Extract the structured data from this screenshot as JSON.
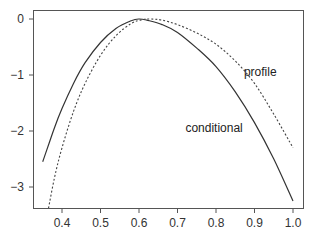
{
  "chart_data": {
    "type": "line",
    "title": "",
    "xlabel": "",
    "ylabel": "",
    "xlim": [
      0.33,
      1.025
    ],
    "ylim": [
      -3.38,
      0.18
    ],
    "grid": false,
    "legend": "none (direct labels)",
    "x_ticks": [
      0.4,
      0.5,
      0.6,
      0.7,
      0.8,
      0.9,
      1.0
    ],
    "x_tick_labels": [
      "0.4",
      "0.5",
      "0.6",
      "0.7",
      "0.8",
      "0.9",
      "1.0"
    ],
    "y_ticks": [
      0,
      -1,
      -2,
      -3
    ],
    "y_tick_labels": [
      "0",
      "−1",
      "−2",
      "−3"
    ],
    "series": [
      {
        "name": "conditional",
        "style": "solid",
        "color": "#333333",
        "x": [
          0.35,
          0.38,
          0.4,
          0.43,
          0.46,
          0.5,
          0.54,
          0.58,
          0.6,
          0.62,
          0.66,
          0.7,
          0.75,
          0.8,
          0.85,
          0.9,
          0.95,
          1.0
        ],
        "y": [
          -2.55,
          -1.95,
          -1.6,
          -1.15,
          -0.78,
          -0.42,
          -0.17,
          -0.03,
          0.0,
          -0.02,
          -0.1,
          -0.24,
          -0.52,
          -0.85,
          -1.3,
          -1.85,
          -2.5,
          -3.25
        ]
      },
      {
        "name": "profile",
        "style": "dashed",
        "color": "#444444",
        "x": [
          0.365,
          0.38,
          0.4,
          0.43,
          0.46,
          0.5,
          0.54,
          0.58,
          0.61,
          0.63,
          0.66,
          0.7,
          0.75,
          0.8,
          0.85,
          0.9,
          0.95,
          1.0
        ],
        "y": [
          -3.38,
          -2.85,
          -2.3,
          -1.65,
          -1.15,
          -0.65,
          -0.3,
          -0.08,
          -0.01,
          0.0,
          -0.02,
          -0.1,
          -0.25,
          -0.45,
          -0.75,
          -1.15,
          -1.7,
          -2.3
        ]
      }
    ],
    "annotations": [
      {
        "text": "profile",
        "x": 0.915,
        "y": -0.95
      },
      {
        "text": "conditional",
        "x": 0.795,
        "y": -1.95
      }
    ]
  },
  "labels": {
    "profile": "profile",
    "conditional": "conditional"
  }
}
